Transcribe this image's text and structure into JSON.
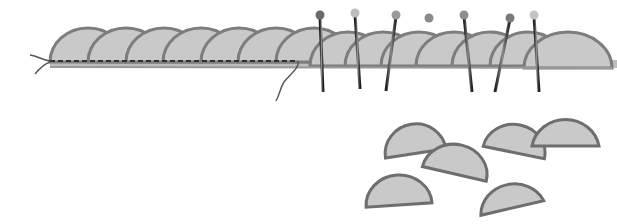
{
  "illustration": {
    "subject": "Scalloped half-circle fabric pieces overlapped in a strip, partly basted with running stitch and partly pinned, plus loose half-circle pieces",
    "colors": {
      "fabric_fill": "#c9c9c9",
      "fabric_outline": "#7d7d7d",
      "stitch": "#2e2e2e",
      "thread": "#555555",
      "pin_shaft": "#3a3a3a",
      "pin_heads": [
        "#6a6a6a",
        "#bdbdbd",
        "#9a9a9a",
        "#8a8a8a",
        "#8d8d8d",
        "#7a7a7a",
        "#c4c4c4"
      ]
    },
    "strip": {
      "sewn_scallops": 7,
      "pinned_scallops": 7,
      "pins": 7
    },
    "loose_pieces": 6
  }
}
